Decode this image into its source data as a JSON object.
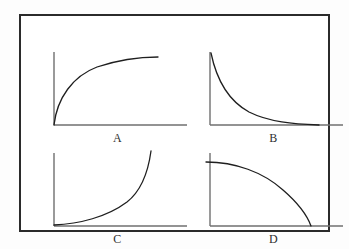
{
  "figure": {
    "border_color": "#2b2b2b",
    "background_color": "#ffffff",
    "axis_color": "#6f6f6f",
    "curve_color": "#1f1f1f"
  },
  "panels": [
    {
      "id": "A",
      "label": "A",
      "description": "saturating increasing curve rising from origin and leveling off",
      "curve_path": "M 9 79 C 12 52, 28 30, 52 21 C 76 13, 96 11, 113 11",
      "x_axis": "M 9 79 L 142 79",
      "y_axis": "M 9 6 L 9 79"
    },
    {
      "id": "B",
      "label": "B",
      "description": "exponential decay falling steeply from high value toward the axis",
      "curve_path": "M 10 7 C 16 36, 28 55, 48 66 C 68 76, 92 78, 118 79",
      "x_axis": "M 9 79 L 142 79",
      "y_axis": "M 9 6 L 9 79"
    },
    {
      "id": "C",
      "label": "C",
      "description": "exponential growth starting flat near origin then rising steeply",
      "curve_path": "M 9 78 C 34 77, 62 70, 82 55 C 96 44, 103 26, 106 4",
      "x_axis": "M 9 79 L 142 79",
      "y_axis": "M 9 6 L 9 79"
    },
    {
      "id": "D",
      "label": "D",
      "description": "quarter-circle style decline, flat at top then dropping to meet the axis",
      "curve_path": "M 5 15 C 34 15, 62 25, 82 43 C 97 56, 106 68, 110 79",
      "x_axis": "M 9 79 L 142 79",
      "y_axis": "M 9 6 L 9 79"
    }
  ],
  "chart_data": {
    "type": "line",
    "title": "",
    "xlabel": "",
    "ylabel": "",
    "grid": false,
    "legend": "none",
    "layout": "2x2 panel grid of unlabeled axes, each with a single curve",
    "panels": [
      {
        "name": "A",
        "shape": "concave-down increasing (saturating / logarithmic)",
        "x": [
          0,
          0.1,
          0.2,
          0.3,
          0.4,
          0.5,
          0.6,
          0.7,
          0.8,
          0.9,
          1.0
        ],
        "y": [
          0.0,
          0.38,
          0.61,
          0.75,
          0.84,
          0.89,
          0.93,
          0.95,
          0.97,
          0.98,
          0.98
        ],
        "xlim": [
          0,
          1
        ],
        "ylim": [
          0,
          1
        ]
      },
      {
        "name": "B",
        "shape": "exponential decay (concave-up decreasing)",
        "x": [
          0,
          0.1,
          0.2,
          0.3,
          0.4,
          0.5,
          0.6,
          0.7,
          0.8,
          0.9,
          1.0
        ],
        "y": [
          1.0,
          0.7,
          0.49,
          0.34,
          0.24,
          0.17,
          0.12,
          0.08,
          0.05,
          0.03,
          0.02
        ],
        "xlim": [
          0,
          1
        ],
        "ylim": [
          0,
          1
        ]
      },
      {
        "name": "C",
        "shape": "exponential growth (concave-up increasing)",
        "x": [
          0,
          0.1,
          0.2,
          0.3,
          0.4,
          0.5,
          0.6,
          0.7,
          0.8,
          0.9,
          1.0
        ],
        "y": [
          0.0,
          0.02,
          0.05,
          0.09,
          0.15,
          0.22,
          0.32,
          0.45,
          0.62,
          0.82,
          1.0
        ],
        "xlim": [
          0,
          1
        ],
        "ylim": [
          0,
          1
        ]
      },
      {
        "name": "D",
        "shape": "concave-down decreasing, reaching zero (quarter circle)",
        "x": [
          0,
          0.1,
          0.2,
          0.3,
          0.4,
          0.5,
          0.6,
          0.7,
          0.8,
          0.9,
          1.0
        ],
        "y": [
          0.9,
          0.9,
          0.88,
          0.85,
          0.81,
          0.75,
          0.67,
          0.57,
          0.44,
          0.27,
          0.0
        ],
        "xlim": [
          0,
          1
        ],
        "ylim": [
          0,
          1
        ]
      }
    ]
  }
}
